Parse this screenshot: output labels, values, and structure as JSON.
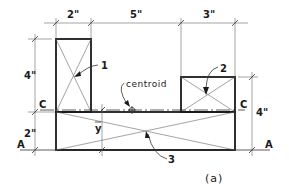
{
  "figure": {
    "caption": "(a)",
    "dimensions": {
      "top": [
        "2\"",
        "5\"",
        "3\""
      ],
      "left_upper": "4\"",
      "left_lower": "2\"",
      "right": "4\""
    },
    "axes": {
      "centroid_axis_left": "C",
      "centroid_axis_right": "C",
      "reference_axis_left": "A",
      "reference_axis_right": "A"
    },
    "callouts": {
      "part1": "1",
      "part2": "2",
      "part3": "3",
      "centroid": "centroid",
      "ybar": "y"
    }
  }
}
